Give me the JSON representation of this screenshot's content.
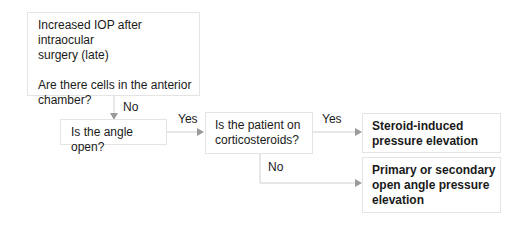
{
  "diagram": {
    "type": "flowchart",
    "nodes": [
      {
        "id": "start",
        "lines": [
          "Increased IOP after intraocular",
          "surgery (late)"
        ],
        "question_lines": [
          "Are there cells in the anterior",
          "chamber?"
        ]
      },
      {
        "id": "angle",
        "text": "Is the angle open?"
      },
      {
        "id": "steroids",
        "lines": [
          "Is the patient on",
          "corticosteroids?"
        ]
      },
      {
        "id": "steroid_result",
        "lines": [
          "Steroid-induced",
          "pressure elevation"
        ],
        "bold": true
      },
      {
        "id": "poag_result",
        "lines": [
          "Primary or secondary",
          "open angle pressure",
          "elevation"
        ],
        "bold": true
      }
    ],
    "edges": [
      {
        "from": "start",
        "to": "angle",
        "label": "No"
      },
      {
        "from": "angle",
        "to": "steroids",
        "label": "Yes"
      },
      {
        "from": "steroids",
        "to": "steroid_result",
        "label": "Yes"
      },
      {
        "from": "steroids",
        "to": "poag_result",
        "label": "No"
      }
    ]
  },
  "colors": {
    "border": "#e4e4e4",
    "line": "#c8c8c8",
    "arrow": "#9a9a9a",
    "text": "#1a1a1a"
  }
}
